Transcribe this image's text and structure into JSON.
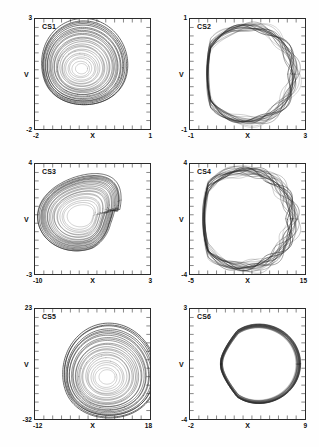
{
  "figure": {
    "background": "#ffffff",
    "ink": "#2b2b2b",
    "rows": 3,
    "cols": 2
  },
  "chart_data": [
    {
      "type": "line",
      "title": "CS1",
      "xlabel": "X",
      "ylabel": "V",
      "xlim": [
        -2,
        1
      ],
      "ylim": [
        -2,
        3
      ],
      "xticks": [
        "-2",
        "1"
      ],
      "yticks": [
        "-2",
        "3"
      ],
      "grid": false,
      "legend": "none",
      "description": "Spiral chaotic attractor in the X-V phase plane; trajectories wind outward from a focus near the centre-left into a rounded teardrop-shaped outer envelope.",
      "attractor": {
        "kind": "spiral",
        "turns": 26,
        "cx": 0.4,
        "cy": 0.55,
        "rx_max": 0.41,
        "ry_max": 0.4,
        "r_min": 0.015,
        "squash": 1.12,
        "lobe": 0.2,
        "jitter": 0.012
      }
    },
    {
      "type": "line",
      "title": "CS2",
      "xlabel": "X",
      "ylabel": "V",
      "xlim": [
        -1,
        3
      ],
      "ylim": [
        -1,
        1
      ],
      "xticks": [
        "-1",
        "3"
      ],
      "yticks": [
        "-1",
        "1"
      ],
      "grid": false,
      "legend": "none",
      "description": "Toroidal (quasi-periodic) attractor; a thick annular band of braided loops with an empty hole at the centre, flattened on the left edge.",
      "attractor": {
        "kind": "torus",
        "turns": 17,
        "cx": 0.5,
        "cy": 0.5,
        "rx": 0.4,
        "ry": 0.43,
        "band": 0.13,
        "modes": 5,
        "ripple": 0.105,
        "flatten_left": 0.2,
        "jitter": 0.008
      }
    },
    {
      "type": "line",
      "title": "CS3",
      "xlabel": "X",
      "ylabel": "V",
      "xlim": [
        -10,
        3
      ],
      "ylim": [
        -3,
        4
      ],
      "xticks": [
        "-10",
        "3"
      ],
      "yticks": [
        "-3",
        "4"
      ],
      "grid": false,
      "legend": "none",
      "description": "Funnel / double-scroll style chaotic attractor; a dense nested family of crescent loops opening to the right with a secondary hump in the upper-right quadrant.",
      "attractor": {
        "kind": "funnel",
        "turns": 22,
        "cx": 0.42,
        "cy": 0.52,
        "rx_max": 0.4,
        "ry_max": 0.4,
        "r_min": 0.1,
        "hump": 0.3,
        "jitter": 0.01
      }
    },
    {
      "type": "line",
      "title": "CS4",
      "xlabel": "X",
      "ylabel": "V",
      "xlim": [
        -5,
        15
      ],
      "ylim": [
        -4,
        4
      ],
      "xticks": [
        "-5",
        "15"
      ],
      "yticks": [
        "-4",
        "4"
      ],
      "grid": false,
      "legend": "none",
      "description": "Broken-torus attractor; a near-circular band whose left side is dense and strongly braided while the right side is a smooth thin arc enclosing an empty core.",
      "attractor": {
        "kind": "torus",
        "turns": 19,
        "cx": 0.47,
        "cy": 0.5,
        "rx": 0.42,
        "ry": 0.44,
        "band": 0.16,
        "modes": 6,
        "ripple": 0.115,
        "flatten_left": 0.26,
        "jitter": 0.009
      }
    },
    {
      "type": "line",
      "title": "CS5",
      "xlabel": "X",
      "ylabel": "V",
      "xlim": [
        -12,
        18
      ],
      "ylim": [
        -32,
        23
      ],
      "xticks": [
        "-12",
        "18"
      ],
      "yticks": [
        "-32",
        "23"
      ],
      "grid": false,
      "legend": "none",
      "description": "Spiral chaotic attractor with the focus displaced toward the upper right; loops expand into a broad rounded envelope filling most of the frame.",
      "attractor": {
        "kind": "spiral",
        "turns": 25,
        "cx": 0.62,
        "cy": 0.38,
        "rx_max": 0.44,
        "ry_max": 0.42,
        "r_min": 0.03,
        "squash": 1.05,
        "lobe": 0.16,
        "jitter": 0.013
      }
    },
    {
      "type": "line",
      "title": "CS6",
      "xlabel": "X",
      "ylabel": "V",
      "xlim": [
        -2,
        9
      ],
      "ylim": [
        -4,
        3
      ],
      "xticks": [
        "-2",
        "9"
      ],
      "yticks": [
        "-4",
        "3"
      ],
      "grid": false,
      "legend": "none",
      "description": "Thin band limit-cycle / weakly chaotic attractor shaped like a rounded triangle with a sharp apex on the left and a thick striped bundle on the right.",
      "attractor": {
        "kind": "triangle",
        "turns": 18,
        "cx": 0.52,
        "cy": 0.5,
        "rx": 0.4,
        "ry": 0.4,
        "spread": 0.09,
        "apex": 0.92,
        "jitter": 0.005
      }
    }
  ]
}
